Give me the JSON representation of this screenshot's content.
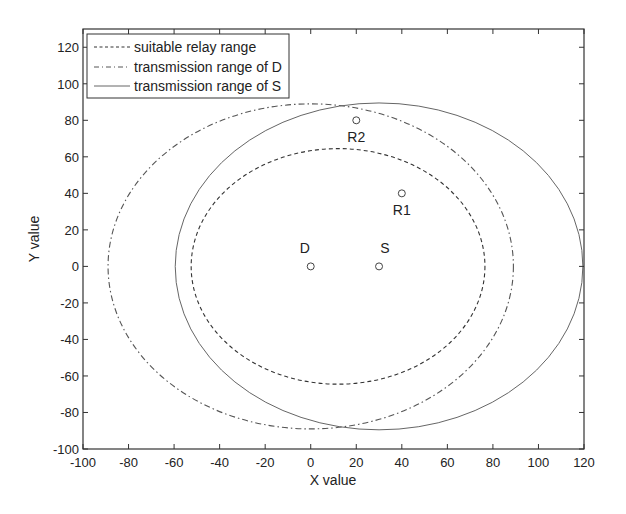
{
  "chart_data": {
    "type": "scatter",
    "title": "",
    "xlabel": "X value",
    "ylabel": "Y value",
    "xlim": [
      -100,
      120
    ],
    "ylim": [
      -100,
      130
    ],
    "xticks": [
      -100,
      -80,
      -60,
      -40,
      -20,
      0,
      20,
      40,
      60,
      80,
      100,
      120
    ],
    "yticks": [
      -100,
      -80,
      -60,
      -40,
      -20,
      0,
      20,
      40,
      60,
      80,
      100,
      120
    ],
    "grid": false,
    "legend_position": "upper left",
    "legend": [
      {
        "label": "suitable relay range",
        "style": "dashed"
      },
      {
        "label": "transmission range of D",
        "style": "dash-dot"
      },
      {
        "label": "transmission range of S",
        "style": "solid"
      }
    ],
    "series": [
      {
        "name": "suitable relay range",
        "shape": "circle",
        "center": [
          12,
          0
        ],
        "radius": 64.5,
        "style": "dashed",
        "color": "#333333"
      },
      {
        "name": "transmission range of D",
        "shape": "circle",
        "center": [
          0,
          0
        ],
        "radius": 89,
        "style": "dash-dot",
        "color": "#555555"
      },
      {
        "name": "transmission range of S",
        "shape": "circle",
        "center": [
          30,
          0
        ],
        "radius": 89.5,
        "style": "solid",
        "color": "#666666"
      }
    ],
    "points": [
      {
        "label": "D",
        "x": 0,
        "y": 0
      },
      {
        "label": "S",
        "x": 30,
        "y": 0
      },
      {
        "label": "R1",
        "x": 40,
        "y": 40
      },
      {
        "label": "R2",
        "x": 20,
        "y": 80
      }
    ]
  }
}
